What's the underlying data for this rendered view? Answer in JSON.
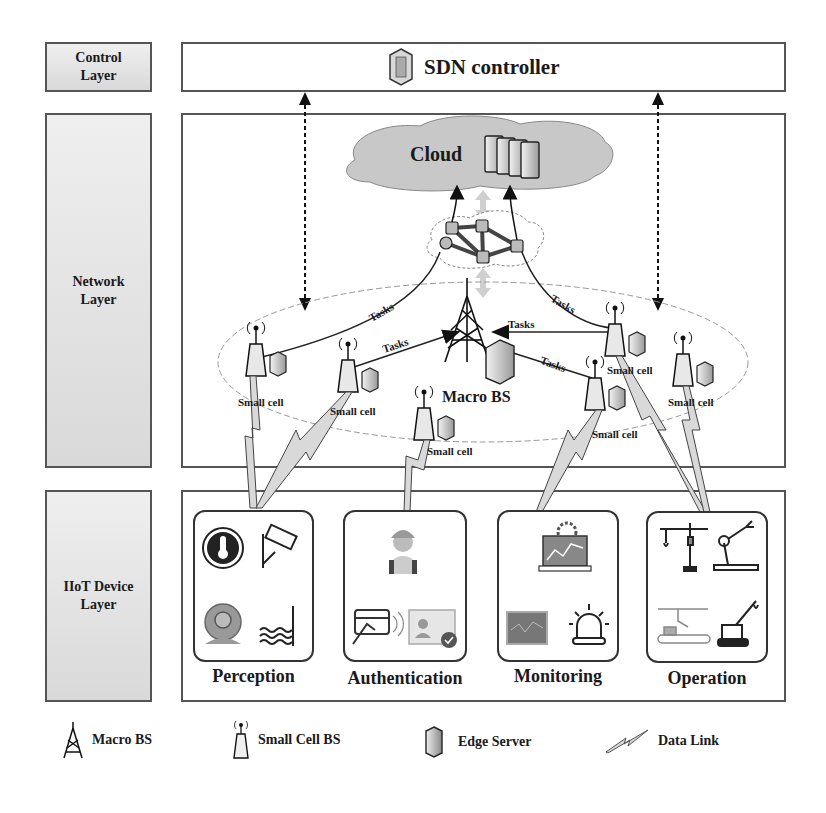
{
  "layers": {
    "control": "Control\nLayer",
    "network": "Network\nLayer",
    "device": "IIoT Device\nLayer"
  },
  "control_layer": {
    "title": "SDN controller",
    "icon": "server-icon"
  },
  "network_layer": {
    "cloud_title": "Cloud",
    "macro_bs_label": "Macro BS",
    "small_cells": [
      {
        "label": "Small cell"
      },
      {
        "label": "Small cell"
      },
      {
        "label": "Small cell"
      },
      {
        "label": "Small cell"
      },
      {
        "label": "Small cell"
      },
      {
        "label": "Small cell"
      }
    ],
    "task_links": [
      "Tasks",
      "Tasks",
      "Tasks",
      "Tasks",
      "Tasks"
    ]
  },
  "device_layer": {
    "groups": [
      {
        "title": "Perception",
        "icons": [
          "thermometer-icon",
          "cctv-camera-icon",
          "webcam-icon",
          "water-level-icon"
        ]
      },
      {
        "title": "Authentication",
        "icons": [
          "worker-icon",
          "card-reader-icon",
          "id-badge-icon"
        ]
      },
      {
        "title": "Monitoring",
        "icons": [
          "dashboard-laptop-icon",
          "monitor-screen-icon",
          "alarm-light-icon"
        ]
      },
      {
        "title": "Operation",
        "icons": [
          "tower-crane-icon",
          "robot-arm-icon",
          "conveyor-icon",
          "crawler-crane-icon"
        ]
      }
    ]
  },
  "legend": {
    "items": [
      {
        "icon": "macro-bs-icon",
        "label": "Macro BS"
      },
      {
        "icon": "small-cell-bs-icon",
        "label": "Small Cell BS"
      },
      {
        "icon": "edge-server-icon",
        "label": "Edge Server"
      },
      {
        "icon": "data-link-icon",
        "label": "Data Link"
      }
    ]
  },
  "colors": {
    "border": "#555555",
    "label_fill": "#e3e3e3",
    "cloud_fill": "#c8c8c8",
    "data_link_fill": "#d9d9d9"
  }
}
